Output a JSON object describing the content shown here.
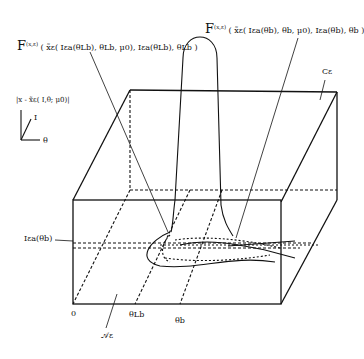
{
  "diagram": {
    "labels": {
      "F_left_prefix": "F",
      "F_left_sup": "(x,ε)",
      "F_left_args": "( x̃ε( Iεa(θLb), θLb, μ0), Iεa(θLb), θLb )",
      "F_right_prefix": "F",
      "F_right_sup": "(x,ε)",
      "F_right_args": "( x̃ε( Iεa(θb), θb, μ0), Iεa(θb), θb )",
      "vertical_axis": "|x - x̃ε( I,θ; μ0)|",
      "axis_I": "I",
      "axis_theta": "θ",
      "manifold": "Cε",
      "level": "Iεa(θb)",
      "origin": "0",
      "theta_L": "θLb",
      "theta_b": "θb",
      "annulus": "𝒜ε"
    },
    "colors": {
      "line": "#111111",
      "background": "#ffffff"
    }
  }
}
